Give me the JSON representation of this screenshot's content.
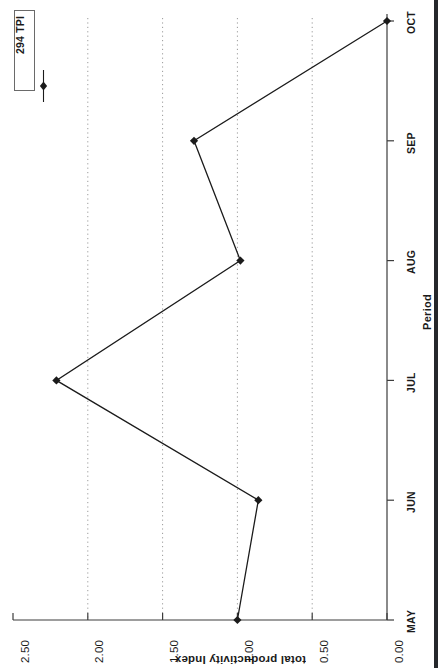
{
  "chart_data": {
    "type": "line",
    "title": "",
    "orientation": "rotated-90-ccw",
    "categories": [
      "MAY",
      "JUN",
      "JUL",
      "AUG",
      "SEP",
      "OCT"
    ],
    "series": [
      {
        "name": "294 TPI",
        "values": [
          1.0,
          0.86,
          2.21,
          0.98,
          1.29,
          0.0
        ],
        "marker": "filled-diamond",
        "color": "#1b1b1b"
      }
    ],
    "xlabel": "Period",
    "ylabel": "total productivity Index",
    "ylim": [
      0.0,
      2.5
    ],
    "ytick_labels": [
      "2.50",
      "2.00",
      "1.50",
      "1.00",
      "0.50",
      "0.00"
    ],
    "ytick_values": [
      2.5,
      2.0,
      1.5,
      1.0,
      0.5,
      0.0
    ],
    "grid": "dotted vertical gridlines at 2.00, 1.50, 1.00, 0.50",
    "legend_position": "top-left",
    "legend_entries": [
      "294 TPI"
    ]
  },
  "legend": {
    "label": "294 TPI"
  },
  "axes": {
    "category_axis_title": "Period",
    "value_axis_title": "total productivity Index"
  },
  "colors": {
    "line": "#1b1b1b",
    "axis": "#3c3c3c",
    "grid": "#9a9a9a",
    "page_edge": "#25272b",
    "background": "#ffffff"
  }
}
